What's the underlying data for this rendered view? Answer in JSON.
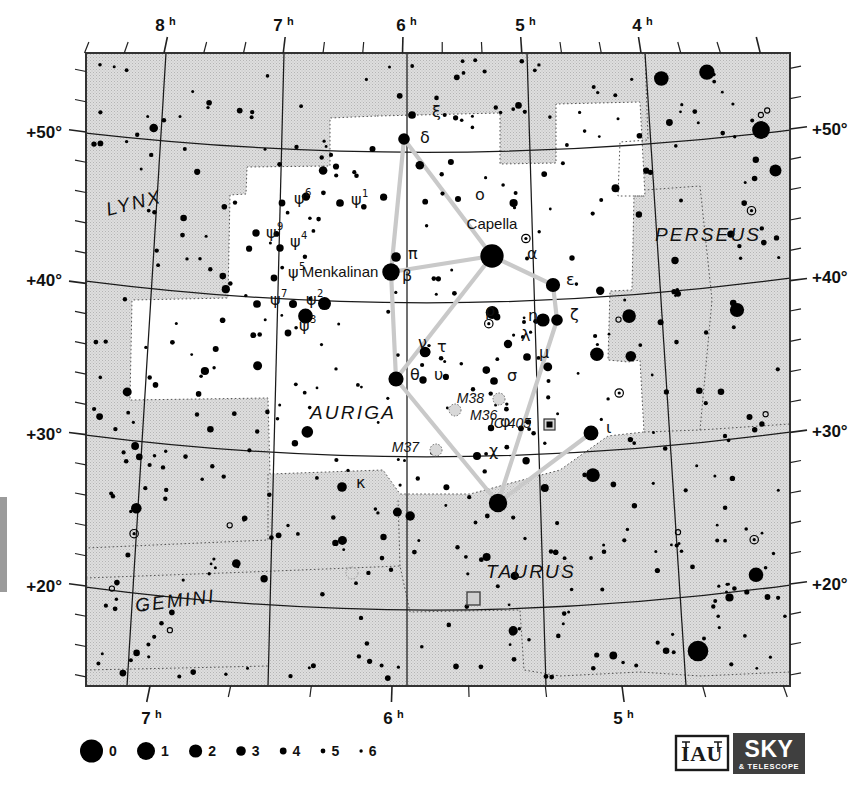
{
  "chart": {
    "title": "Auriga",
    "type": "star-chart",
    "projection": "conic",
    "frame": {
      "x": 86,
      "y": 53,
      "w": 704,
      "h": 633
    },
    "background_fill": "#ffffff",
    "outside_constellation_fill": "#d6d6d6",
    "border_color": "#333333"
  },
  "axes": {
    "ra_top": [
      {
        "label": "8",
        "sup": "h",
        "x": 164
      },
      {
        "label": "7",
        "sup": "h",
        "x": 282
      },
      {
        "label": "6",
        "sup": "h",
        "x": 405
      },
      {
        "label": "5",
        "sup": "h",
        "x": 524
      },
      {
        "label": "4",
        "sup": "h",
        "x": 641
      }
    ],
    "ra_bottom": [
      {
        "label": "7",
        "sup": "h",
        "x": 150
      },
      {
        "label": "6",
        "sup": "h",
        "x": 392
      },
      {
        "label": "5",
        "sup": "h",
        "x": 622
      }
    ],
    "dec_left": [
      {
        "label": "+50°",
        "y": 132
      },
      {
        "label": "+40°",
        "y": 280
      },
      {
        "label": "+30°",
        "y": 434
      },
      {
        "label": "+20°",
        "y": 586
      }
    ],
    "dec_right": [
      {
        "label": "+50°",
        "y": 129
      },
      {
        "label": "+40°",
        "y": 277
      },
      {
        "label": "+30°",
        "y": 431
      },
      {
        "label": "+20°",
        "y": 584
      }
    ]
  },
  "constellations": [
    {
      "name": "LYNX",
      "x": 108,
      "y": 216,
      "rot": -14
    },
    {
      "name": "AURIGA",
      "x": 310,
      "y": 419,
      "rot": 0
    },
    {
      "name": "PERSEUS",
      "x": 655,
      "y": 241,
      "rot": 0
    },
    {
      "name": "GEMINI",
      "x": 136,
      "y": 612,
      "rot": -7
    },
    {
      "name": "TAURUS",
      "x": 486,
      "y": 578,
      "rot": 0
    }
  ],
  "named_stars": [
    {
      "name": "Capella",
      "x": 492,
      "y": 229
    },
    {
      "name": "Menkalinan",
      "x": 340,
      "y": 277
    }
  ],
  "greek_labels": [
    {
      "g": "α",
      "sup": "",
      "x": 527,
      "y": 259
    },
    {
      "g": "β",
      "sup": "",
      "x": 402,
      "y": 281
    },
    {
      "g": "γ",
      "sup": "",
      "x": 0,
      "y": 0
    },
    {
      "g": "δ",
      "sup": "",
      "x": 420,
      "y": 143
    },
    {
      "g": "ε",
      "sup": "",
      "x": 566,
      "y": 285
    },
    {
      "g": "ζ",
      "sup": "",
      "x": 570,
      "y": 320
    },
    {
      "g": "η",
      "sup": "",
      "x": 528,
      "y": 321
    },
    {
      "g": "θ",
      "sup": "",
      "x": 410,
      "y": 380
    },
    {
      "g": "ι",
      "sup": "",
      "x": 606,
      "y": 433
    },
    {
      "g": "κ",
      "sup": "",
      "x": 356,
      "y": 488
    },
    {
      "g": "λ",
      "sup": "",
      "x": 521,
      "y": 341
    },
    {
      "g": "μ",
      "sup": "",
      "x": 539,
      "y": 358
    },
    {
      "g": "ν",
      "sup": "",
      "x": 418,
      "y": 348
    },
    {
      "g": "ξ",
      "sup": "",
      "x": 432,
      "y": 117
    },
    {
      "g": "o",
      "sup": "",
      "x": 475,
      "y": 200
    },
    {
      "g": "π",
      "sup": "",
      "x": 408,
      "y": 259
    },
    {
      "g": "ρ",
      "sup": "",
      "x": 485,
      "y": 316
    },
    {
      "g": "σ",
      "sup": "",
      "x": 507,
      "y": 381
    },
    {
      "g": "τ",
      "sup": "",
      "x": 437,
      "y": 352
    },
    {
      "g": "υ",
      "sup": "",
      "x": 434,
      "y": 380
    },
    {
      "g": "φ",
      "sup": "",
      "x": 500,
      "y": 427
    },
    {
      "g": "χ",
      "sup": "",
      "x": 489,
      "y": 456
    },
    {
      "g": "ψ",
      "sup": "1",
      "x": 351,
      "y": 205
    },
    {
      "g": "ψ",
      "sup": "2",
      "x": 306,
      "y": 305
    },
    {
      "g": "ψ",
      "sup": "3",
      "x": 299,
      "y": 331
    },
    {
      "g": "ψ",
      "sup": "4",
      "x": 290,
      "y": 247
    },
    {
      "g": "ψ",
      "sup": "5",
      "x": 288,
      "y": 278
    },
    {
      "g": "ψ",
      "sup": "6",
      "x": 294,
      "y": 204
    },
    {
      "g": "ψ",
      "sup": "7",
      "x": 270,
      "y": 305
    },
    {
      "g": "ψ",
      "sup": "9",
      "x": 266,
      "y": 238
    }
  ],
  "deep_sky": [
    {
      "name": "M36",
      "x": 455,
      "y": 410,
      "mx": 470,
      "my": 420,
      "kind": "open-cluster"
    },
    {
      "name": "M37",
      "x": 436,
      "y": 450,
      "mx": 419,
      "my": 452,
      "kind": "open-cluster"
    },
    {
      "name": "M38",
      "x": 499,
      "y": 399,
      "mx": 484,
      "my": 403,
      "kind": "open-cluster"
    },
    {
      "name": "IC 405",
      "x": 549,
      "y": 424,
      "mx": 531,
      "my": 428,
      "kind": "nebula"
    }
  ],
  "legend": {
    "title": "magnitudes",
    "entries": [
      {
        "mag": "0",
        "r": 11.5
      },
      {
        "mag": "1",
        "r": 9.0
      },
      {
        "mag": "2",
        "r": 6.6
      },
      {
        "mag": "3",
        "r": 4.8
      },
      {
        "mag": "4",
        "r": 3.4
      },
      {
        "mag": "5",
        "r": 2.4
      },
      {
        "mag": "6",
        "r": 1.7
      }
    ]
  },
  "credits": {
    "iau": "IAU",
    "sky": "SKY",
    "telescope": "& TELESCOPE"
  },
  "chart_data": {
    "type": "scatter",
    "title": "Auriga",
    "xlabel": "Right Ascension (hours)",
    "ylabel": "Declination (degrees)",
    "xlim": [
      8.4,
      3.4
    ],
    "ylim": [
      14,
      54
    ],
    "grid": true,
    "legend_position": "bottom-left",
    "stars": [
      {
        "x": 492,
        "y": 256,
        "m": 0.1,
        "id": "alpha-Capella"
      },
      {
        "x": 391,
        "y": 272,
        "m": 1.9,
        "id": "beta-Menkalinan"
      },
      {
        "x": 404,
        "y": 139,
        "m": 3.7,
        "id": "delta"
      },
      {
        "x": 412,
        "y": 115,
        "m": 4.9,
        "id": "xi"
      },
      {
        "x": 553,
        "y": 285,
        "m": 2.9,
        "id": "epsilon"
      },
      {
        "x": 557,
        "y": 320,
        "m": 3.7,
        "id": "zeta"
      },
      {
        "x": 543,
        "y": 320,
        "m": 3.2,
        "id": "eta"
      },
      {
        "x": 396,
        "y": 379,
        "m": 2.6,
        "id": "theta"
      },
      {
        "x": 591,
        "y": 433,
        "m": 2.7,
        "id": "iota"
      },
      {
        "x": 342,
        "y": 487,
        "m": 4.3,
        "id": "kappa"
      },
      {
        "x": 508,
        "y": 344,
        "m": 4.7,
        "id": "lambda"
      },
      {
        "x": 527,
        "y": 357,
        "m": 4.9,
        "id": "mu"
      },
      {
        "x": 425,
        "y": 352,
        "m": 4.0,
        "id": "nu"
      },
      {
        "x": 458,
        "y": 199,
        "m": 5.4,
        "id": "omicron"
      },
      {
        "x": 396,
        "y": 257,
        "m": 4.3,
        "id": "pi"
      },
      {
        "x": 497,
        "y": 317,
        "m": 5.2,
        "id": "rho"
      },
      {
        "x": 494,
        "y": 381,
        "m": 4.9,
        "id": "sigma"
      },
      {
        "x": 426,
        "y": 352,
        "m": 4.5,
        "id": "tau"
      },
      {
        "x": 423,
        "y": 380,
        "m": 5.0,
        "id": "upsilon"
      },
      {
        "x": 491,
        "y": 428,
        "m": 5.3,
        "id": "phi"
      },
      {
        "x": 477,
        "y": 456,
        "m": 4.8,
        "id": "chi"
      },
      {
        "x": 340,
        "y": 203,
        "m": 4.9,
        "id": "psi1"
      },
      {
        "x": 293,
        "y": 304,
        "m": 4.8,
        "id": "psi2"
      },
      {
        "x": 288,
        "y": 333,
        "m": 5.2,
        "id": "psi3"
      },
      {
        "x": 280,
        "y": 248,
        "m": 5.0,
        "id": "psi4"
      },
      {
        "x": 274,
        "y": 278,
        "m": 5.2,
        "id": "psi5"
      },
      {
        "x": 282,
        "y": 203,
        "m": 5.2,
        "id": "psi6"
      },
      {
        "x": 257,
        "y": 304,
        "m": 4.9,
        "id": "psi7"
      },
      {
        "x": 256,
        "y": 233,
        "m": 5.0,
        "id": "psi9"
      },
      {
        "x": 761,
        "y": 130,
        "m": 1.8,
        "id": "perseus-alpha"
      },
      {
        "x": 737,
        "y": 310,
        "m": 2.9,
        "id": "perseus-bright"
      },
      {
        "x": 498,
        "y": 503,
        "m": 1.6,
        "id": "beta-tauri"
      },
      {
        "x": 698,
        "y": 651,
        "m": 0.9,
        "id": "aldebaran-region"
      }
    ]
  }
}
